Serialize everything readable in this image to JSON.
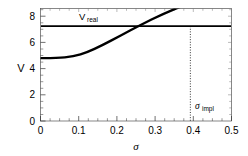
{
  "chart_data": {
    "type": "line",
    "title": "",
    "subtitle": "",
    "xlabel": "σ",
    "ylabel": "V",
    "xlim": [
      0,
      0.5
    ],
    "ylim": [
      0,
      8.6
    ],
    "grid": false,
    "legend_position": "none",
    "background_color": "#ffffff",
    "line_color": "#000000",
    "xticks": [
      0,
      0.1,
      0.2,
      0.3,
      0.4,
      0.5
    ],
    "xtick_labels": [
      "0",
      "0.1",
      "0.2",
      "0.3",
      "0.4",
      "0.5"
    ],
    "yticks": [
      0,
      2,
      4,
      6,
      8
    ],
    "ytick_labels": [
      "0",
      "2",
      "4",
      "6",
      "8"
    ],
    "series": [
      {
        "name": "V(σ)",
        "type": "curve",
        "x": [
          0.0,
          0.02,
          0.04,
          0.06,
          0.08,
          0.1,
          0.12,
          0.14,
          0.16,
          0.18,
          0.2,
          0.22,
          0.24,
          0.26,
          0.28,
          0.3,
          0.32,
          0.34,
          0.36,
          0.38,
          0.4,
          0.42,
          0.44,
          0.46,
          0.48,
          0.5
        ],
        "values": [
          4.8,
          4.8,
          4.8,
          4.81,
          4.83,
          4.87,
          4.94,
          5.04,
          5.17,
          5.32,
          5.49,
          5.67,
          5.86,
          6.06,
          6.26,
          6.47,
          6.68,
          6.89,
          7.1,
          7.18,
          7.42,
          7.63,
          7.84,
          8.04,
          8.23,
          8.42
        ]
      },
      {
        "name": "V_real",
        "type": "hline",
        "value": 7.25
      }
    ],
    "annotations": [
      {
        "name": "v-real-label",
        "text_main": "V",
        "text_sub": "real",
        "x": 0.17,
        "y": 8.15
      },
      {
        "name": "sigma-impl-label",
        "text_main": "σ",
        "text_sub": "impl",
        "x": 0.405,
        "y": 1.45
      }
    ],
    "markers": [
      {
        "name": "sigma-impl-dashed-line",
        "type": "vline-dashed",
        "x": 0.392,
        "y_from": 0,
        "y_to": 7.25
      }
    ]
  },
  "axes": {
    "y_axis_title": "V",
    "x_axis_title": "σ"
  }
}
